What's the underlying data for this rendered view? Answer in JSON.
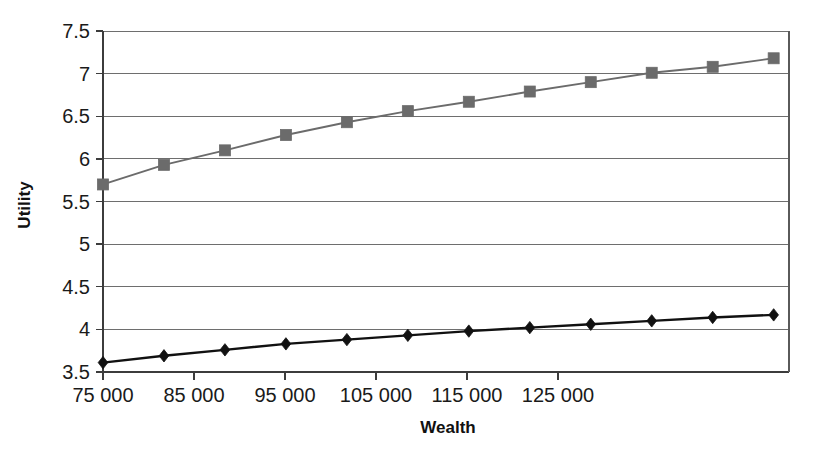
{
  "chart_data": {
    "type": "line",
    "title": "",
    "xlabel": "Wealth",
    "ylabel": "Utility",
    "xlim": [
      75000,
      148900
    ],
    "ylim": [
      3.5,
      7.5
    ],
    "grid": true,
    "legend": "none",
    "x_tick_labels": [
      "75 000",
      "85 000",
      "95 000",
      "105 000",
      "115 000",
      "125 000"
    ],
    "x_tick_values": [
      75000,
      85000,
      95000,
      105000,
      115000,
      125000
    ],
    "y_tick_labels": [
      "3.5",
      "4",
      "4.5",
      "5",
      "5.5",
      "6",
      "6.5",
      "7",
      "7.5"
    ],
    "y_tick_values": [
      3.5,
      4,
      4.5,
      5,
      5.5,
      6,
      6.5,
      7,
      7.5
    ],
    "x": [
      75000,
      81700,
      88400,
      95100,
      101800,
      108500,
      115200,
      121900,
      128600,
      135300,
      142000,
      148700
    ],
    "series": [
      {
        "name": "upper-utility-curve",
        "marker": "square",
        "color": "#6b6b6b",
        "values": [
          5.7,
          5.93,
          6.1,
          6.28,
          6.43,
          6.56,
          6.67,
          6.79,
          6.9,
          7.01,
          7.08,
          7.18
        ]
      },
      {
        "name": "lower-utility-curve",
        "marker": "diamond",
        "color": "#111111",
        "values": [
          3.61,
          3.69,
          3.76,
          3.83,
          3.88,
          3.93,
          3.98,
          4.02,
          4.06,
          4.1,
          4.14,
          4.17
        ]
      }
    ]
  },
  "colors": {
    "upper_series": "#6b6b6b",
    "lower_series": "#111111",
    "gridline": "#6e6e6e",
    "axis": "#3c3c3c",
    "background": "#ffffff"
  },
  "axes": {
    "x_title": "Wealth",
    "y_title": "Utility"
  }
}
